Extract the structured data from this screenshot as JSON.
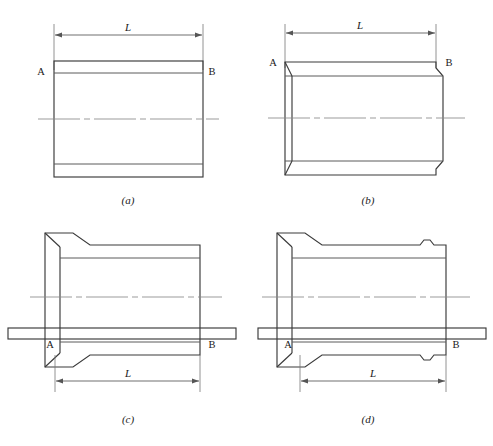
{
  "figure": {
    "type": "engineering-drawing",
    "panel_count": 4,
    "line_color": "#3a3a3a",
    "centerline_color": "#8a8a8a",
    "dimension_color": "#555555",
    "background": "#ffffff"
  },
  "panels": [
    {
      "id": "a",
      "caption": "(a)",
      "dimension_label": "L",
      "end_label_left": "A",
      "end_label_right": "B",
      "form": "plain straight tube, square ends"
    },
    {
      "id": "b",
      "caption": "(b)",
      "dimension_label": "L",
      "end_label_left": "A",
      "end_label_right": "B",
      "form": "straight tube with chamfered bore ends"
    },
    {
      "id": "c",
      "caption": "(c)",
      "dimension_label": "L",
      "end_label_left": "A",
      "end_label_right": "B",
      "form": "tube with tapered flange at left end, mandrel bar through bore"
    },
    {
      "id": "d",
      "caption": "(d)",
      "dimension_label": "L",
      "end_label_left": "A",
      "end_label_right": "B",
      "form": "tube with tapered flange at left end and relief notches at right end, mandrel bar through bore"
    }
  ],
  "labels": {
    "A": "A",
    "B": "B",
    "L": "L",
    "caption_a": "(a)",
    "caption_b": "(b)",
    "caption_c": "(c)",
    "caption_d": "(d)"
  }
}
